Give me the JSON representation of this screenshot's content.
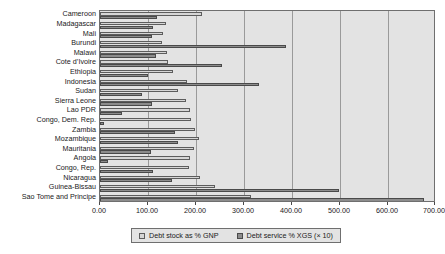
{
  "chart_data": {
    "type": "bar",
    "orientation": "horizontal",
    "title": "",
    "xlabel": "",
    "ylabel": "",
    "xlim": [
      0,
      700
    ],
    "xticks": [
      0,
      100,
      200,
      300,
      400,
      500,
      600,
      700
    ],
    "xtick_labels": [
      "0.00",
      "100.00",
      "200.00",
      "300.00",
      "400.00",
      "500.00",
      "600.00",
      "700.00"
    ],
    "grid": true,
    "legend_position": "bottom",
    "categories": [
      "Cameroon",
      "Madagascar",
      "Mali",
      "Burundi",
      "Malawi",
      "Cote d’Ivoire",
      "Ethiopia",
      "Indonesia",
      "Sudan",
      "Sierra Leone",
      "Lao PDR",
      "Congo, Dem. Rep.",
      "Zambia",
      "Mozambique",
      "Mauritania",
      "Angola",
      "Congo, Rep.",
      "Nicaragua",
      "Guinea-Bissau",
      "Sao Tome and Principe"
    ],
    "series": [
      {
        "name": "Debt stock as % GNP",
        "color": "#d6d6d6",
        "values": [
          212,
          137,
          132,
          130,
          140,
          142,
          152,
          182,
          162,
          180,
          187,
          190,
          198,
          206,
          196,
          188,
          186,
          208,
          240,
          315
        ]
      },
      {
        "name": "Debt service % XGS (× 10)",
        "color": "#8c8c8c",
        "values": [
          118,
          110,
          108,
          388,
          116,
          255,
          100,
          332,
          88,
          108,
          45,
          8,
          156,
          162,
          106,
          17,
          110,
          150,
          498,
          676
        ]
      }
    ]
  },
  "legend": {
    "entries": [
      {
        "label": "Debt stock as % GNP"
      },
      {
        "label": "Debt service % XGS (× 10)"
      }
    ]
  }
}
